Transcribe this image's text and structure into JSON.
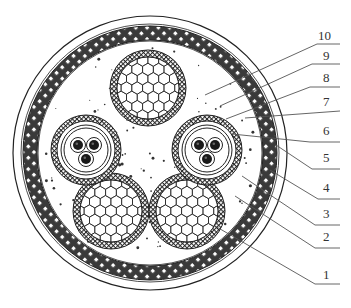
{
  "diagram": {
    "type": "cable-cross-section",
    "colors": {
      "line": "#222222",
      "armor_fill": "#3a3a3a",
      "background": "#ffffff",
      "leader": "#555555",
      "label": "#333333"
    },
    "outer": {
      "cx": 150,
      "cy": 153,
      "r_outer": 137,
      "r_armor_out": 127,
      "r_armor_in": 113
    },
    "large_conductors": [
      {
        "cx": 148,
        "cy": 88,
        "r": 38
      },
      {
        "cx": 111,
        "cy": 211,
        "r": 38
      },
      {
        "cx": 187,
        "cy": 211,
        "r": 38
      }
    ],
    "control_units": [
      {
        "cx": 86,
        "cy": 150,
        "r": 35
      },
      {
        "cx": 207,
        "cy": 150,
        "r": 35
      }
    ],
    "labels": [
      {
        "text": "10",
        "x": 318,
        "y": 40,
        "line": [
          [
            205,
            95
          ],
          [
            317,
            44
          ],
          [
            340,
            44
          ]
        ]
      },
      {
        "text": "9",
        "x": 323,
        "y": 60,
        "line": [
          [
            220,
            106
          ],
          [
            312,
            64
          ],
          [
            340,
            64
          ]
        ]
      },
      {
        "text": "8",
        "x": 323,
        "y": 82,
        "line": [
          [
            226,
            119
          ],
          [
            310,
            87
          ],
          [
            340,
            87
          ]
        ]
      },
      {
        "text": "7",
        "x": 323,
        "y": 106,
        "line": [
          [
            245,
            118
          ],
          [
            340,
            111
          ]
        ]
      },
      {
        "text": "6",
        "x": 323,
        "y": 135,
        "line": [
          [
            232,
            134
          ],
          [
            310,
            142
          ],
          [
            340,
            142
          ]
        ]
      },
      {
        "text": "5",
        "x": 323,
        "y": 162,
        "line": [
          [
            276,
            145
          ],
          [
            312,
            169
          ],
          [
            340,
            169
          ]
        ]
      },
      {
        "text": "4",
        "x": 323,
        "y": 192,
        "line": [
          [
            270,
            170
          ],
          [
            318,
            199
          ],
          [
            340,
            199
          ]
        ]
      },
      {
        "text": "3",
        "x": 323,
        "y": 218,
        "line": [
          [
            242,
            176
          ],
          [
            315,
            225
          ],
          [
            340,
            225
          ]
        ]
      },
      {
        "text": "2",
        "x": 323,
        "y": 241,
        "line": [
          [
            235,
            196
          ],
          [
            315,
            248
          ],
          [
            340,
            248
          ]
        ]
      },
      {
        "text": "1",
        "x": 323,
        "y": 279,
        "line": [
          [
            215,
            226
          ],
          [
            315,
            284
          ],
          [
            340,
            284
          ]
        ]
      }
    ]
  }
}
